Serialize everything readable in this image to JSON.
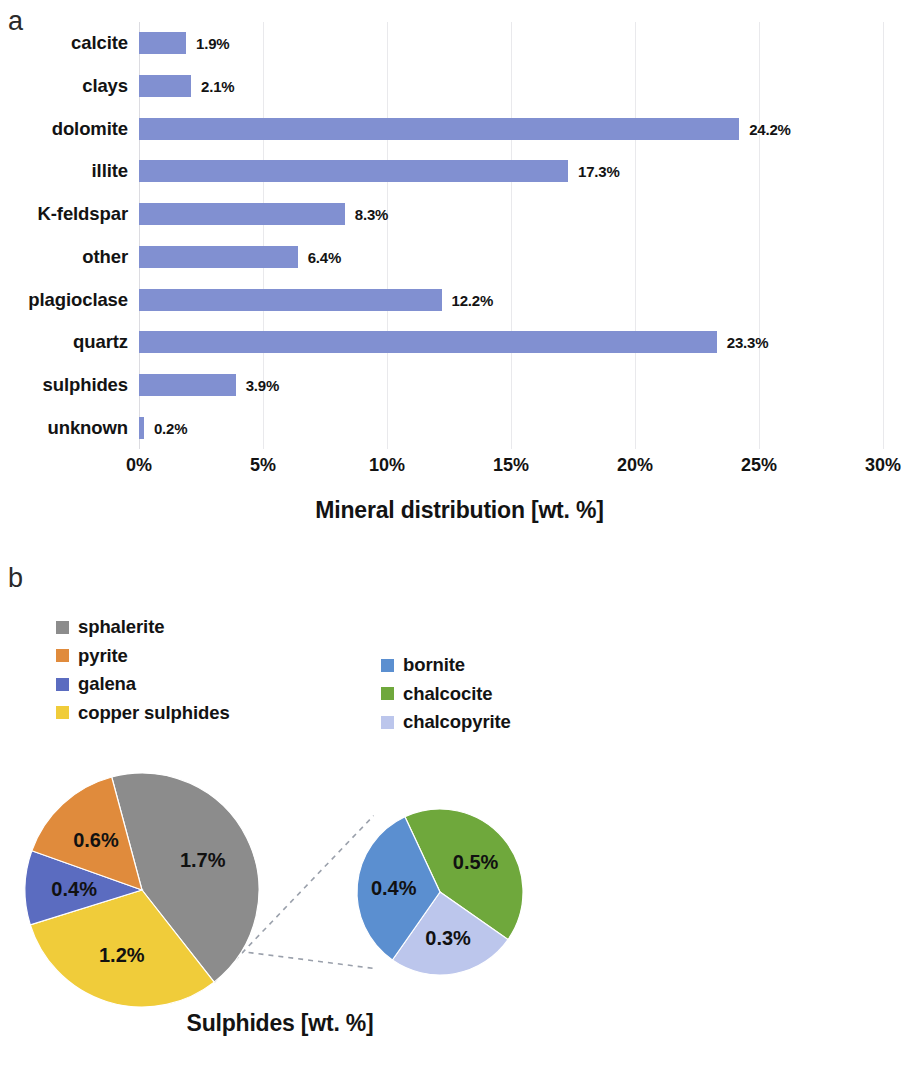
{
  "figure": {
    "panel_a_letter": "a",
    "panel_b_letter": "b"
  },
  "panel_a": {
    "title": "Mineral distribution [wt. %]",
    "axis_ticks": [
      "0%",
      "5%",
      "10%",
      "15%",
      "20%",
      "25%",
      "30%"
    ],
    "bar_color": "#8190d1"
  },
  "panel_b": {
    "title": "Sulphides [wt. %]",
    "legend_left": [
      {
        "label": "sphalerite",
        "color": "#8c8c8c"
      },
      {
        "label": "pyrite",
        "color": "#e08b3c"
      },
      {
        "label": "galena",
        "color": "#5b6cc0"
      },
      {
        "label": "copper sulphides",
        "color": "#f0cc3a"
      }
    ],
    "legend_right": [
      {
        "label": "bornite",
        "color": "#5b8fd0"
      },
      {
        "label": "chalcocite",
        "color": "#6fa83c"
      },
      {
        "label": "chalcopyrite",
        "color": "#bcc6ec"
      }
    ]
  },
  "chart_data": [
    {
      "type": "bar",
      "orientation": "horizontal",
      "title": "Mineral distribution [wt. %]",
      "xlabel": "Mineral distribution [wt. %]",
      "ylabel": "",
      "xlim": [
        0,
        30
      ],
      "xticks": [
        0,
        5,
        10,
        15,
        20,
        25,
        30
      ],
      "xtick_labels": [
        "0%",
        "5%",
        "10%",
        "15%",
        "20%",
        "25%",
        "30%"
      ],
      "grid": true,
      "legend": false,
      "categories": [
        "calcite",
        "clays",
        "dolomite",
        "illite",
        "K-feldspar",
        "other",
        "plagioclase",
        "quartz",
        "sulphides",
        "unknown"
      ],
      "values": [
        1.9,
        2.1,
        24.2,
        17.3,
        8.3,
        6.4,
        12.2,
        23.3,
        3.9,
        0.2
      ],
      "data_labels": [
        "1.9%",
        "2.1%",
        "24.2%",
        "17.3%",
        "8.3%",
        "6.4%",
        "12.2%",
        "23.3%",
        "3.9%",
        "0.2%"
      ],
      "color": "#8190d1"
    },
    {
      "type": "pie",
      "name": "sulphides-main-pie",
      "title": "Sulphides [wt. %]",
      "legend": true,
      "legend_position": "top",
      "labels": [
        "sphalerite",
        "copper sulphides",
        "galena",
        "pyrite"
      ],
      "values": [
        1.7,
        1.2,
        0.4,
        0.6
      ],
      "data_labels": [
        "1.7%",
        "1.2%",
        "0.4%",
        "0.6%"
      ],
      "colors": [
        "#8c8c8c",
        "#f0cc3a",
        "#5b6cc0",
        "#e08b3c"
      ],
      "total": 3.9
    },
    {
      "type": "pie",
      "name": "copper-sulphides-breakout-pie",
      "title": "Sulphides [wt. %]",
      "legend": true,
      "legend_position": "top",
      "labels": [
        "chalcocite",
        "chalcopyrite",
        "bornite"
      ],
      "values": [
        0.5,
        0.3,
        0.4
      ],
      "data_labels": [
        "0.5%",
        "0.3%",
        "0.4%"
      ],
      "colors": [
        "#6fa83c",
        "#bcc6ec",
        "#5b8fd0"
      ],
      "total": 1.2
    }
  ]
}
